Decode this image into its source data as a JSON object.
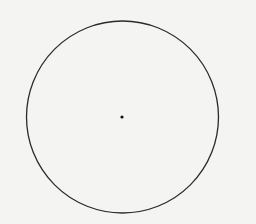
{
  "diagram": {
    "type": "circle-with-center",
    "background": "#f4f4f2",
    "circle": {
      "cx": 122.5,
      "cy": 117,
      "r": 96,
      "stroke": "#2a2a2a",
      "stroke_width": 1.3
    },
    "center_point": {
      "cx": 122,
      "cy": 117,
      "r": 1.6,
      "fill": "#111111"
    }
  }
}
